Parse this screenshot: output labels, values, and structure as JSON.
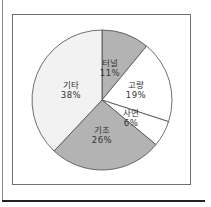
{
  "chart_data": {
    "type": "pie",
    "title": "",
    "categories": [
      "터널",
      "고량",
      "사면",
      "기초",
      "기타"
    ],
    "values": [
      11,
      19,
      6,
      26,
      38
    ],
    "labels": [
      "터널\n11%",
      "고량\n19%",
      "사면\n6%",
      "기초\n26%",
      "기타\n38%"
    ],
    "unit": "%",
    "start_angle_deg": 90,
    "direction": "clockwise",
    "colors": [
      "#b3b3b3",
      "#ffffff",
      "#ffffff",
      "#b3b3b3",
      "#f2f2f2"
    ],
    "legend": "none",
    "grid": false
  },
  "slices": [
    {
      "name": "터널",
      "pct": "11%",
      "color": "#b3b3b3"
    },
    {
      "name": "고량",
      "pct": "19%",
      "color": "#ffffff"
    },
    {
      "name": "사면",
      "pct": "6%",
      "color": "#ffffff"
    },
    {
      "name": "기초",
      "pct": "26%",
      "color": "#b3b3b3"
    },
    {
      "name": "기타",
      "pct": "38%",
      "color": "#f2f2f2"
    }
  ]
}
